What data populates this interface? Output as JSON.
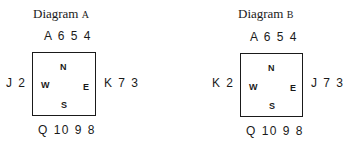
{
  "diagrams": [
    {
      "title_word": "Diagram",
      "title_letter": "A",
      "north": "A 6 5 4",
      "west": "J 2",
      "east": "K 7 3",
      "south": "Q 10 9 8",
      "seats": {
        "n": "N",
        "w": "W",
        "e": "E",
        "s": "S"
      }
    },
    {
      "title_word": "Diagram",
      "title_letter": "B",
      "north": "A 6 5 4",
      "west": "K 2",
      "east": "J 7 3",
      "south": "Q 10 9 8",
      "seats": {
        "n": "N",
        "w": "W",
        "e": "E",
        "s": "S"
      }
    }
  ]
}
